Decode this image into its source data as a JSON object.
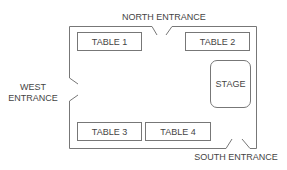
{
  "diagram": {
    "type": "floor-plan",
    "entrances": {
      "north": "NORTH ENTRANCE",
      "west_line1": "WEST",
      "west_line2": "ENTRANCE",
      "south": "SOUTH ENTRANCE"
    },
    "tables": [
      {
        "label": "TABLE 1"
      },
      {
        "label": "TABLE 2"
      },
      {
        "label": "TABLE 3"
      },
      {
        "label": "TABLE 4"
      }
    ],
    "stage": {
      "label": "STAGE"
    },
    "colors": {
      "line": "#777777",
      "text": "#444444",
      "background": "#ffffff"
    }
  }
}
